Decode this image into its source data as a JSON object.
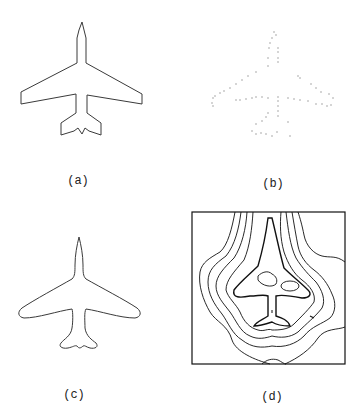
{
  "figure": {
    "panels": [
      {
        "id": "a",
        "label": "(a)",
        "description": "airplane silhouette outline (polygonal)"
      },
      {
        "id": "b",
        "label": "(b)",
        "description": "sparse noisy edge points of airplane"
      },
      {
        "id": "c",
        "label": "(c)",
        "description": "smooth recovered airplane contour"
      },
      {
        "id": "d",
        "label": "(d)",
        "description": "contour / level-set map of airplane in bounding box"
      }
    ]
  },
  "colors": {
    "line": "#3a3a3a",
    "contour": "#111111",
    "points": "#8a8a8a",
    "background": "#ffffff"
  }
}
